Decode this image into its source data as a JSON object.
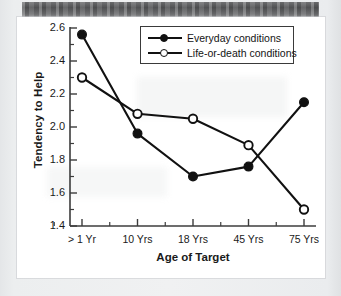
{
  "figure": {
    "background_color": "#ffffff",
    "page_color": "#e9ebec",
    "line_color": "#111111"
  },
  "chart_data": {
    "type": "line",
    "title": "",
    "xlabel": "Age of Target",
    "ylabel": "Tendency to Help",
    "categories": [
      "> 1 Yr",
      "10 Yrs",
      "18 Yrs",
      "45 Yrs",
      "75 Yrs"
    ],
    "ylim": [
      1.4,
      2.6
    ],
    "yticks": [
      1.4,
      1.6,
      1.8,
      2.0,
      2.2,
      2.4,
      2.6
    ],
    "ytick_labels": [
      "1.4",
      "1.6",
      "1.8",
      "2.0",
      "2.2",
      "2.4",
      "2.6"
    ],
    "minor_ticks": true,
    "grid": false,
    "legend_position": "top-center",
    "series": [
      {
        "name": "Everyday conditions",
        "marker": "filled-circle",
        "color": "#111111",
        "values": [
          2.56,
          1.96,
          1.7,
          1.76,
          2.15
        ]
      },
      {
        "name": "Life-or-death conditions",
        "marker": "open-circle",
        "color": "#111111",
        "values": [
          2.3,
          2.08,
          2.05,
          1.89,
          1.5
        ]
      }
    ]
  },
  "legend": {
    "items": [
      {
        "label": "Everyday conditions",
        "marker": "filled-circle"
      },
      {
        "label": "Life-or-death conditions",
        "marker": "open-circle"
      }
    ]
  }
}
